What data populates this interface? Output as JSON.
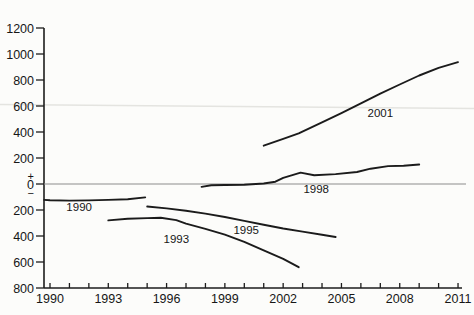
{
  "chart_data": {
    "type": "line",
    "title": "",
    "xlabel": "",
    "ylabel": "",
    "grid": false,
    "legend": "inline-series-labels",
    "x_axis": {
      "min": 1990,
      "max": 2011,
      "minor_tick_step_years": 1,
      "labeled_tick_step_years": 3,
      "tick_labels": [
        "1990",
        "1993",
        "1996",
        "1999",
        "2002",
        "2005",
        "2008",
        "2011"
      ]
    },
    "y_axis": {
      "min": -800,
      "max": 1200,
      "tick_step": 200,
      "labels_are_absolute_values": true,
      "tick_labels_top_to_bottom": [
        "1200",
        "1000",
        "800",
        "600",
        "400",
        "200",
        "0",
        "200",
        "400",
        "600",
        "800"
      ],
      "zero_markers": {
        "plus": "+",
        "zero": "0",
        "minus": "−"
      }
    },
    "zero_line": true,
    "series": [
      {
        "name": "1990",
        "label": "1990",
        "label_pos": {
          "x": 1991.5,
          "y": -180
        },
        "points": [
          [
            1989.7,
            -122
          ],
          [
            1990,
            -125
          ],
          [
            1991,
            -128
          ],
          [
            1992,
            -126
          ],
          [
            1993,
            -122
          ],
          [
            1994,
            -117
          ],
          [
            1994.9,
            -103
          ]
        ]
      },
      {
        "name": "1993",
        "label": "1993",
        "label_pos": {
          "x": 1996.5,
          "y": -420
        },
        "points": [
          [
            1993,
            -280
          ],
          [
            1994,
            -268
          ],
          [
            1995,
            -262
          ],
          [
            1995.7,
            -260
          ],
          [
            1996.5,
            -278
          ],
          [
            1997,
            -305
          ],
          [
            1998,
            -345
          ],
          [
            1999,
            -390
          ],
          [
            2000,
            -445
          ],
          [
            2001,
            -510
          ],
          [
            2002,
            -575
          ],
          [
            2002.8,
            -640
          ]
        ]
      },
      {
        "name": "1995",
        "label": "1995",
        "label_pos": {
          "x": 2000.1,
          "y": -350
        },
        "points": [
          [
            1995,
            -173
          ],
          [
            1996,
            -188
          ],
          [
            1997,
            -206
          ],
          [
            1998,
            -228
          ],
          [
            1999,
            -254
          ],
          [
            2000,
            -284
          ],
          [
            2001,
            -314
          ],
          [
            2002,
            -342
          ],
          [
            2003,
            -366
          ],
          [
            2004,
            -390
          ],
          [
            2004.7,
            -408
          ]
        ]
      },
      {
        "name": "1998",
        "label": "1998",
        "label_pos": {
          "x": 2003.7,
          "y": -35
        },
        "points": [
          [
            1997.8,
            -22
          ],
          [
            1998.3,
            -10
          ],
          [
            1999,
            -8
          ],
          [
            2000,
            -5
          ],
          [
            2001,
            4
          ],
          [
            2001.6,
            18
          ],
          [
            2002,
            48
          ],
          [
            2002.9,
            88
          ],
          [
            2003.6,
            68
          ],
          [
            2004.7,
            76
          ],
          [
            2005.8,
            92
          ],
          [
            2006.5,
            118
          ],
          [
            2007.4,
            138
          ],
          [
            2008.2,
            140
          ],
          [
            2009,
            150
          ]
        ]
      },
      {
        "name": "2001",
        "label": "2001",
        "label_pos": {
          "x": 2007.0,
          "y": 550
        },
        "points": [
          [
            2001,
            295
          ],
          [
            2002,
            348
          ],
          [
            2002.8,
            390
          ],
          [
            2004,
            475
          ],
          [
            2005,
            545
          ],
          [
            2006,
            620
          ],
          [
            2007,
            695
          ],
          [
            2008,
            765
          ],
          [
            2009,
            835
          ],
          [
            2010,
            893
          ],
          [
            2011,
            938
          ]
        ]
      }
    ],
    "colors": {
      "line": "#1b1b1b",
      "axis": "#1c1c1c",
      "zero_line": "#8c8c8c",
      "text": "#161616",
      "scan_artifact": "#e4e4e0",
      "background": "#fcfcfa"
    },
    "scan_artifact_line": {
      "approx_value": 600,
      "full_width": true
    }
  }
}
